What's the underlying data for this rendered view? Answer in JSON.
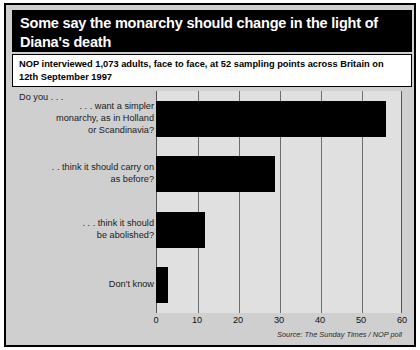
{
  "figure": {
    "title": "Some say the monarchy should change in the light of Diana's death",
    "subtitle": "NOP interviewed 1,073 adults, face to face, at 52 sampling points across Britain on 12th September 1997",
    "prompt_label": "Do you . . .",
    "source": "Source: The Sunday Times / NOP poll",
    "colors": {
      "banner_background": "#000000",
      "banner_text": "#ffffff",
      "panel_background": "#cfcfcf",
      "plot_background": "#e0e0e0",
      "bar_fill": "#000000",
      "gridline": "#6e6e6e",
      "frame": "#000000"
    }
  },
  "chart_data": {
    "type": "bar",
    "orientation": "horizontal",
    "title": "Some say the monarchy should change in the light of Diana's death",
    "subtitle": "NOP interviewed 1,073 adults, face to face, at 52 sampling points across Britain on 12th September 1997",
    "xlabel": "",
    "ylabel": "",
    "xlim": [
      0,
      60
    ],
    "xticks": [
      0,
      10,
      20,
      30,
      40,
      50,
      60
    ],
    "tick_labels": [
      "0",
      "10",
      "20",
      "30",
      "40",
      "50",
      "60"
    ],
    "grid": true,
    "legend": false,
    "categories": [
      ". . . want a simpler monarchy, as in Holland or Scandinavia?",
      ". . think it should carry on as before?",
      ". . . think it should be abolished?",
      "Don't know"
    ],
    "values": [
      56,
      29,
      12,
      3
    ],
    "series": [
      {
        "name": "Share of respondents (%)",
        "values": [
          56,
          29,
          12,
          3
        ]
      }
    ],
    "annotations": [
      "Do you . . ."
    ],
    "source": "Source: The Sunday Times / NOP poll"
  },
  "category_lines": [
    [
      ". . . want a simpler",
      "monarchy, as in Holland",
      "or Scandinavia?"
    ],
    [
      ". . think it should carry on",
      "as before?"
    ],
    [
      ". . . think it should",
      "be abolished?"
    ],
    [
      "Don't know"
    ]
  ]
}
